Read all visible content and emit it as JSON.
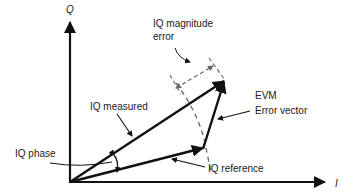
{
  "diagram": {
    "title": "",
    "axes": {
      "q_label": "Q",
      "i_label": "I"
    },
    "labels": {
      "iq_magnitude_error_line1": "IQ magnitude",
      "iq_magnitude_error_line2": "error",
      "evm_line1": "EVM",
      "evm_line2": "Error vector",
      "iq_measured": "IQ measured",
      "iq_phase": "IQ phase",
      "iq_reference": "IQ reference"
    },
    "colors": {
      "stroke": "#111111",
      "dashed": "#666666",
      "background": "#ffffff"
    },
    "geometry": {
      "origin": [
        70,
        182
      ],
      "iq_measured_tip": [
        225,
        80
      ],
      "iq_reference_tip": [
        203,
        148
      ]
    }
  }
}
